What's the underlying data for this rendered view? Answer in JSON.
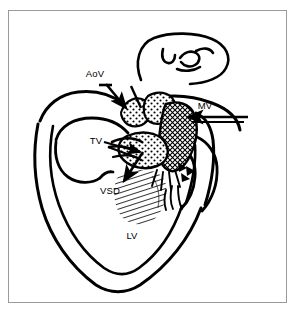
{
  "figure": {
    "kind": "medical-line-diagram",
    "background_color": "#ffffff",
    "ink_color": "#000000",
    "frame_color": "#9a9a9a"
  },
  "labels": {
    "aortic_valve": "AoV",
    "mitral_valve": "MV",
    "tricuspid_valve": "TV",
    "ventricular_septal_defect": "VSD",
    "left_ventricle": "LV"
  },
  "annotations": {
    "arrow_aov": "arrow-pointing-to-aortic-valve",
    "arrow_mv": "arrow-pointing-to-mitral-valve",
    "arrow_tv": "arrow-pointing-to-tricuspid-valve",
    "arrow_vsd": "arrow-pointing-to-septal-defect"
  },
  "textures": {
    "valve_leaflet": "stipple-dots",
    "mitral_leaflet": "cross-hatch",
    "septal_defect": "diagonal-hatch"
  }
}
